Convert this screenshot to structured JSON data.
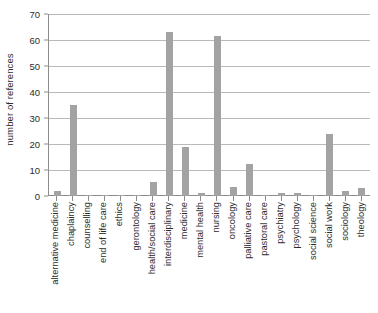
{
  "chart_data": {
    "type": "bar",
    "title": "",
    "xlabel": "",
    "ylabel": "number of references",
    "ylim": [
      0,
      70
    ],
    "yticks": [
      0,
      10,
      20,
      30,
      40,
      50,
      60,
      70
    ],
    "grid": true,
    "legend": false,
    "bar_color": "#a3a3a3",
    "categories": [
      "alternative medicine",
      "chaplaincy",
      "counselling",
      "end of life care",
      "ethics",
      "gerontology",
      "health/social care",
      "interdisciplinary",
      "medicine",
      "mental health",
      "nursing",
      "oncology",
      "palliative care",
      "pastoral care",
      "psychiatry",
      "psychology",
      "social science",
      "social work",
      "sociology",
      "theology"
    ],
    "values": [
      2,
      35,
      0.5,
      0.5,
      0.5,
      0.5,
      5.5,
      63,
      19,
      1.3,
      61.5,
      3.5,
      12.5,
      0.5,
      1.3,
      1.2,
      0.5,
      24,
      2,
      3
    ]
  }
}
